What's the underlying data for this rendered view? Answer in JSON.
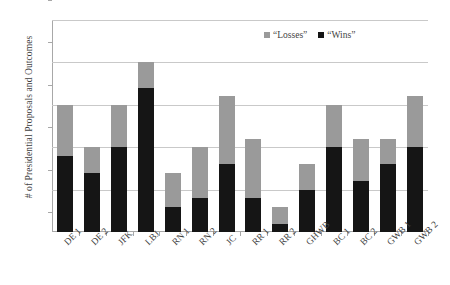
{
  "chart_data": {
    "type": "bar",
    "subtype": "stacked-vertical",
    "title": "",
    "xlabel": "",
    "ylabel": "# of Presidential Proposals and Outcomes",
    "ylim": [
      0,
      25
    ],
    "yticks": [
      0,
      5,
      10,
      15,
      20,
      25
    ],
    "ytick_labels": [
      "0",
      "5",
      "10",
      "15",
      "20",
      "25"
    ],
    "grid": "horizontal",
    "legend_position": "top-right-inside",
    "categories": [
      "DE 1",
      "DE 2",
      "JFK",
      "LBJ",
      "RN 1",
      "RN 2",
      "JC",
      "RR 1",
      "RR 2",
      "GHWB",
      "BC 1",
      "BC 2",
      "GWB 1",
      "GWB 2"
    ],
    "series": [
      {
        "name": "“Wins”",
        "color": "#151515",
        "values": [
          9,
          7,
          10,
          17,
          3,
          4,
          8,
          4,
          1,
          5,
          10,
          6,
          8,
          10
        ]
      },
      {
        "name": "“Losses”",
        "color": "#9a9a9a",
        "values": [
          6,
          3,
          5,
          3,
          4,
          6,
          8,
          7,
          2,
          3,
          5,
          5,
          3,
          6
        ]
      }
    ],
    "totals": [
      15,
      10,
      15,
      20,
      7,
      10,
      16,
      11,
      3,
      8,
      15,
      11,
      11,
      16
    ],
    "stack_order_bottom_to_top": [
      "“Wins”",
      "“Losses”"
    ]
  },
  "legend": {
    "entries": [
      {
        "label": "“Losses”",
        "color": "#9a9a9a"
      },
      {
        "label": "“Wins”",
        "color": "#151515"
      }
    ]
  },
  "colors": {
    "wins": "#151515",
    "losses": "#9a9a9a",
    "gridline": "#c9c9c9",
    "axis": "#a8a8a8",
    "text": "#3f3f3f",
    "background": "#ffffff"
  }
}
